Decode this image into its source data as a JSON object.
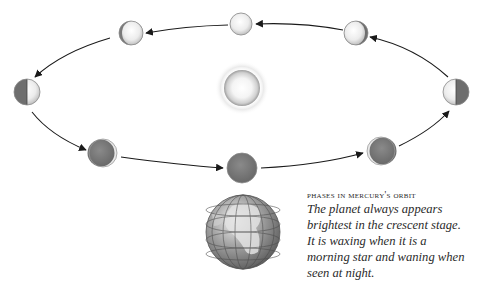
{
  "diagram": {
    "title": "Phases in Mercury's orbit",
    "caption_title": "PHASES IN MERCURY'S ORBIT",
    "caption_lines": [
      "The planet always appears",
      "brightest in the crescent stage.",
      "It is waxing when it is a",
      "morning star and waning when",
      "seen at night."
    ],
    "colors": {
      "lit": "#f2f2f2",
      "dark": "#7a7a7a",
      "arrow": "#1a1a1a",
      "sun_glow": "#e6e6e6"
    },
    "bodies": [
      {
        "name": "sun",
        "label": "Sun",
        "cx": 242,
        "cy": 88,
        "r": 18
      },
      {
        "name": "earth",
        "label": "Earth",
        "cx": 243,
        "cy": 232,
        "r": 37
      }
    ],
    "phases": [
      {
        "name": "full",
        "cx": 241,
        "cy": 24,
        "r": 11,
        "lit_fraction": 1.0,
        "lit_side": "both"
      },
      {
        "name": "waning-gibbous-left",
        "cx": 131,
        "cy": 33,
        "r": 12,
        "lit_fraction": 0.85,
        "lit_side": "right"
      },
      {
        "name": "last-quarter",
        "cx": 27,
        "cy": 92,
        "r": 13,
        "lit_fraction": 0.5,
        "lit_side": "right"
      },
      {
        "name": "waning-crescent",
        "cx": 103,
        "cy": 153,
        "r": 14,
        "lit_fraction": 0.1,
        "lit_side": "right"
      },
      {
        "name": "new",
        "cx": 242,
        "cy": 168,
        "r": 15,
        "lit_fraction": 0.0,
        "lit_side": "none"
      },
      {
        "name": "waxing-crescent",
        "cx": 381,
        "cy": 151,
        "r": 14,
        "lit_fraction": 0.1,
        "lit_side": "left"
      },
      {
        "name": "first-quarter",
        "cx": 456,
        "cy": 92,
        "r": 13,
        "lit_fraction": 0.5,
        "lit_side": "left"
      },
      {
        "name": "waxing-gibbous",
        "cx": 356,
        "cy": 33,
        "r": 12,
        "lit_fraction": 0.85,
        "lit_side": "left"
      }
    ],
    "orbit_direction": "counter-clockwise as viewed (top moving right-to-left)"
  }
}
